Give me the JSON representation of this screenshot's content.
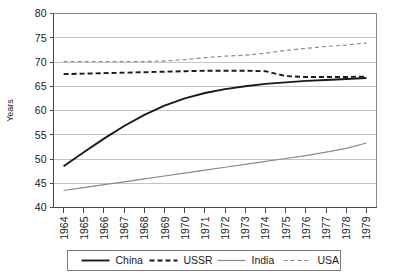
{
  "chart_data": {
    "type": "line",
    "title": "",
    "xlabel": "",
    "ylabel": "Years",
    "ylim": [
      40,
      80
    ],
    "ytick_step": 5,
    "yticks": [
      "40",
      "45",
      "50",
      "55",
      "60",
      "65",
      "70",
      "75",
      "80"
    ],
    "grid": true,
    "legend_position": "bottom",
    "x": [
      "1964",
      "1965",
      "1966",
      "1967",
      "1968",
      "1969",
      "1970",
      "1971",
      "1972",
      "1973",
      "1974",
      "1975",
      "1976",
      "1977",
      "1978",
      "1979"
    ],
    "categories": [
      "1964",
      "1965",
      "1966",
      "1967",
      "1968",
      "1969",
      "1970",
      "1971",
      "1972",
      "1973",
      "1974",
      "1975",
      "1976",
      "1977",
      "1978",
      "1979"
    ],
    "series": [
      {
        "name": "China",
        "color": "#1a1a1a",
        "style": "solid",
        "width": 1.9,
        "values": [
          48.5,
          51.4,
          54.2,
          56.8,
          59.1,
          61.0,
          62.5,
          63.6,
          64.4,
          65.0,
          65.5,
          65.8,
          66.1,
          66.3,
          66.5,
          66.7
        ]
      },
      {
        "name": "USSR",
        "color": "#1a1a1a",
        "style": "dashed",
        "width": 1.9,
        "values": [
          67.5,
          67.6,
          67.7,
          67.8,
          67.9,
          68.0,
          68.1,
          68.2,
          68.2,
          68.2,
          68.1,
          67.1,
          66.9,
          66.9,
          66.9,
          67.0
        ]
      },
      {
        "name": "India",
        "color": "#8a8a8a",
        "style": "solid",
        "width": 1.2,
        "values": [
          43.5,
          44.1,
          44.7,
          45.3,
          45.9,
          46.5,
          47.1,
          47.7,
          48.3,
          48.9,
          49.5,
          50.1,
          50.7,
          51.4,
          52.2,
          53.3
        ]
      },
      {
        "name": "USA",
        "color": "#8a8a8a",
        "style": "dashed",
        "width": 1.2,
        "values": [
          70.1,
          70.1,
          70.1,
          70.1,
          70.1,
          70.2,
          70.5,
          70.9,
          71.2,
          71.4,
          71.8,
          72.4,
          72.8,
          73.2,
          73.5,
          73.9
        ]
      }
    ]
  },
  "legend": {
    "items": [
      {
        "label": "China"
      },
      {
        "label": "USSR"
      },
      {
        "label": "India"
      },
      {
        "label": "USA"
      }
    ]
  }
}
